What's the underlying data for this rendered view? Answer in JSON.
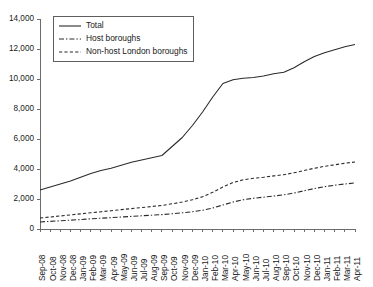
{
  "chart_data": {
    "type": "line",
    "title": "",
    "subtitle": "",
    "xlabel": "",
    "ylabel": "",
    "grid": false,
    "legend_position": "top-left",
    "ylim": [
      0,
      14000
    ],
    "ytick_labels": [
      "0",
      "2,000",
      "4,000",
      "6,000",
      "8,000",
      "10,000",
      "12,000",
      "14,000"
    ],
    "ytick_values": [
      0,
      2000,
      4000,
      6000,
      8000,
      10000,
      12000,
      14000
    ],
    "categories": [
      "Sep-08",
      "Oct-08",
      "Nov-08",
      "Dec-08",
      "Jan-09",
      "Feb-09",
      "Mar-09",
      "Apr-09",
      "May-09",
      "Jun-09",
      "Jul-09",
      "Aug-09",
      "Sep-09",
      "Oct-09",
      "Nov-09",
      "Dec-09",
      "Jan-10",
      "Feb-10",
      "Mar-10",
      "Apr-10",
      "May-10",
      "Jun-10",
      "Jul-10",
      "Aug-10",
      "Sep-10",
      "Oct-10",
      "Nov-10",
      "Dec-10",
      "Jan-11",
      "Feb-11",
      "Mar-11",
      "Apr-11"
    ],
    "series": [
      {
        "name": "Total",
        "style": "solid",
        "values": [
          2600,
          2800,
          3000,
          3200,
          3450,
          3700,
          3900,
          4050,
          4250,
          4450,
          4600,
          4750,
          4900,
          5500,
          6100,
          6900,
          7800,
          8800,
          9700,
          9950,
          10050,
          10100,
          10200,
          10350,
          10450,
          10750,
          11150,
          11500,
          11750,
          11950,
          12150,
          12300
        ]
      },
      {
        "name": "Host  boroughs",
        "style": "dash-dot",
        "values": [
          470,
          510,
          550,
          590,
          630,
          680,
          720,
          760,
          800,
          840,
          880,
          920,
          960,
          1020,
          1080,
          1150,
          1250,
          1400,
          1600,
          1800,
          1950,
          2050,
          2120,
          2200,
          2280,
          2400,
          2550,
          2700,
          2820,
          2920,
          3000,
          3070
        ]
      },
      {
        "name": "Non-host London boroughs",
        "style": "dashed",
        "values": [
          730,
          800,
          870,
          940,
          1010,
          1080,
          1150,
          1220,
          1290,
          1360,
          1430,
          1500,
          1570,
          1680,
          1800,
          1950,
          2150,
          2450,
          2800,
          3100,
          3280,
          3380,
          3450,
          3540,
          3620,
          3750,
          3900,
          4050,
          4180,
          4280,
          4380,
          4470
        ]
      }
    ]
  }
}
